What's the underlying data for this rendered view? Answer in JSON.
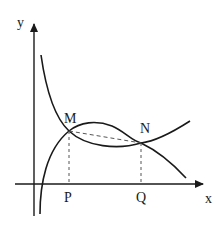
{
  "diagram": {
    "type": "function-graph",
    "axes": {
      "x_label": "x",
      "y_label": "y"
    },
    "points": {
      "M": {
        "label": "M"
      },
      "N": {
        "label": "N"
      },
      "P": {
        "label": "P"
      },
      "Q": {
        "label": "Q"
      }
    },
    "curves": [
      {
        "name": "decreasing-curve",
        "description": "Decreasing curve from top-left through M and N down toward x-axis"
      },
      {
        "name": "increasing-curve",
        "description": "Log-like curve rising from below the x-axis near origin, through M, over N, rising to the right"
      }
    ],
    "segments": [
      {
        "name": "MN-dashed",
        "style": "dashed",
        "from": "M",
        "to": "N"
      },
      {
        "name": "MP-dashed",
        "style": "dashed",
        "from": "M",
        "to": "P"
      },
      {
        "name": "NQ-dashed",
        "style": "dashed",
        "from": "N",
        "to": "Q"
      }
    ],
    "colors": {
      "line": "#1a1a1a",
      "dash": "#555555",
      "background": "#ffffff"
    }
  }
}
